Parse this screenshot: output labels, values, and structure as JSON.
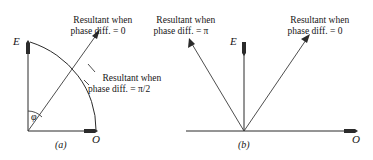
{
  "figure": {
    "caption_a": "(a)",
    "caption_b": "(b)",
    "panels": [
      {
        "id": "a",
        "label": "(a)",
        "axis_vertical_label": "E",
        "axis_horizontal_label": "O",
        "angle_label": "φ",
        "annotations": [
          {
            "name": "resultant-phase-0",
            "line1": "Resultant when",
            "line2": "phase diff. = 0"
          },
          {
            "name": "resultant-phase-pi-over-2",
            "line1": "Resultant when",
            "line2": "phase diff. = π/2"
          }
        ]
      },
      {
        "id": "b",
        "label": "(b)",
        "axis_vertical_label": "E",
        "axis_horizontal_label": "O",
        "annotations": [
          {
            "name": "resultant-phase-pi",
            "line1": "Resultant when",
            "line2": "phase diff. = π"
          },
          {
            "name": "resultant-phase-0",
            "line1": "Resultant when",
            "line2": "phase diff. = 0"
          }
        ]
      }
    ],
    "colors": {
      "ink": "#2b2b2b",
      "text": "#161616",
      "background": "#ffffff"
    }
  }
}
